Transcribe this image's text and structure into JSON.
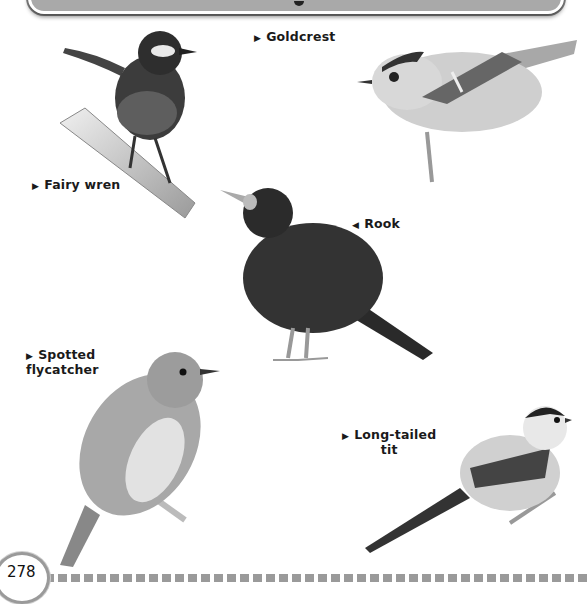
{
  "page": {
    "page_number": "278",
    "header_banner": {
      "visible_text": ""
    }
  },
  "labels": [
    {
      "arrow": "▶",
      "text": "Goldcrest"
    },
    {
      "arrow": "▶",
      "text": "Fairy wren"
    },
    {
      "arrow": "◀",
      "text": "Rook"
    },
    {
      "arrow": "▶",
      "text": "Spotted",
      "text2": "flycatcher"
    },
    {
      "arrow": "▶",
      "text": "Long-tailed",
      "text2": "tit"
    }
  ],
  "illustrations": [
    {
      "name": "fairy-wren",
      "perch": "branch"
    },
    {
      "name": "goldcrest",
      "perch": "twig"
    },
    {
      "name": "rook",
      "perch": "ground"
    },
    {
      "name": "spotted-flycatcher",
      "perch": "branch"
    },
    {
      "name": "long-tailed-tit",
      "perch": "twig"
    }
  ]
}
